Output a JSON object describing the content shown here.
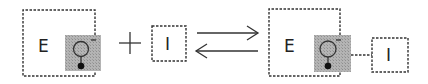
{
  "diagram": {
    "type": "binding-equilibrium",
    "colors": {
      "stroke": "#333333",
      "shade": "#a9a9a9",
      "background": "#ffffff"
    },
    "reactants": {
      "enzyme": {
        "label": "E"
      },
      "operator": "+",
      "inhibitor": {
        "label": "I"
      }
    },
    "equilibrium_arrows": {
      "forward": "right",
      "reverse": "left"
    },
    "product": {
      "complex": {
        "enzyme_label": "E",
        "inhibitor_label": "I"
      }
    }
  }
}
